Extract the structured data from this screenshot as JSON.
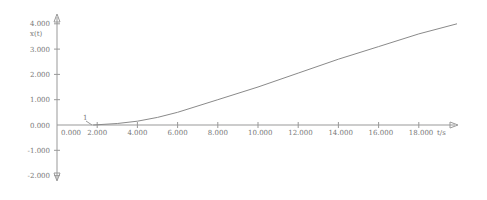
{
  "chart_data": {
    "type": "line",
    "title": "",
    "xlabel": "t/s",
    "ylabel": "x(t)",
    "xlim": [
      0,
      20
    ],
    "ylim": [
      -2.2,
      4.2
    ],
    "grid": false,
    "legend": null,
    "x_ticks": [
      "0.000",
      "2.000",
      "4.000",
      "6.000",
      "8.000",
      "10.000",
      "12.000",
      "14.000",
      "16.000",
      "18.000"
    ],
    "y_ticks": [
      "4.000",
      "3.000",
      "2.000",
      "1.000",
      "0.000",
      "-1.000",
      "-2.000"
    ],
    "annotations": [
      {
        "text": "1",
        "x": 1.5,
        "y": 0.35,
        "note": "curve label pointing to start of curve"
      }
    ],
    "series": [
      {
        "name": "1",
        "x": [
          0,
          1.8,
          3,
          4,
          5,
          6,
          8,
          10,
          12,
          14,
          16,
          18,
          19.9
        ],
        "values": [
          0,
          0,
          0.06,
          0.15,
          0.3,
          0.5,
          1.0,
          1.5,
          2.05,
          2.6,
          3.1,
          3.6,
          4.0
        ]
      }
    ]
  }
}
